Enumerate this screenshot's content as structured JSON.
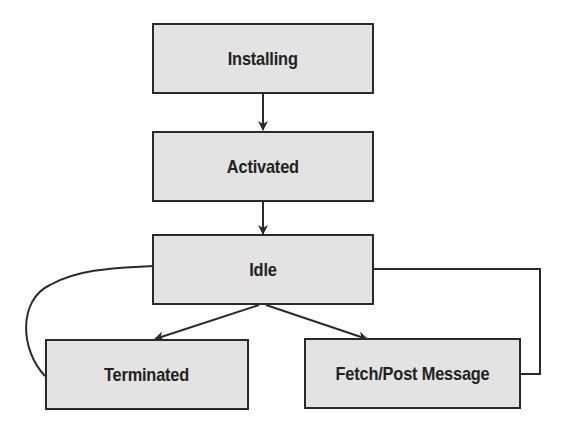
{
  "diagram": {
    "type": "state-flow",
    "nodes": [
      {
        "id": "installing",
        "label": "Installing"
      },
      {
        "id": "activated",
        "label": "Activated"
      },
      {
        "id": "idle",
        "label": "Idle"
      },
      {
        "id": "terminated",
        "label": "Terminated"
      },
      {
        "id": "fetch",
        "label": "Fetch/Post Message"
      }
    ],
    "edges": [
      {
        "from": "installing",
        "to": "activated",
        "style": "arrow"
      },
      {
        "from": "activated",
        "to": "idle",
        "style": "arrow"
      },
      {
        "from": "idle",
        "to": "terminated",
        "style": "arrow"
      },
      {
        "from": "idle",
        "to": "fetch",
        "style": "arrow"
      },
      {
        "from": "terminated",
        "to": "idle",
        "style": "curve"
      },
      {
        "from": "fetch",
        "to": "idle",
        "style": "elbow"
      }
    ],
    "colors": {
      "box_fill": "#e3e3e3",
      "stroke": "#2a2a2a"
    }
  }
}
